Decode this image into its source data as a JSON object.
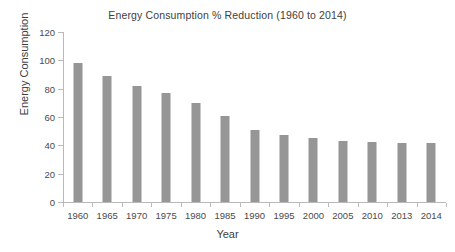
{
  "chart_data": {
    "type": "bar",
    "title": "Energy Consumption % Reduction (1960 to 2014)",
    "xlabel": "Year",
    "ylabel": "Energy Consumption",
    "categories": [
      "1960",
      "1965",
      "1970",
      "1975",
      "1980",
      "1985",
      "1990",
      "1995",
      "2000",
      "2005",
      "2010",
      "2013",
      "2014"
    ],
    "values": [
      98,
      89,
      82,
      77,
      70,
      61,
      51,
      47,
      45,
      43,
      42.5,
      42,
      42
    ],
    "ylim": [
      0,
      120
    ],
    "ytick_step": 20,
    "yticks": [
      "0",
      "20",
      "40",
      "60",
      "80",
      "100",
      "120"
    ],
    "grid": false,
    "legend": false,
    "bar_color": "#969696",
    "axis_color": "#b9b9b9",
    "background": "#ffffff"
  }
}
